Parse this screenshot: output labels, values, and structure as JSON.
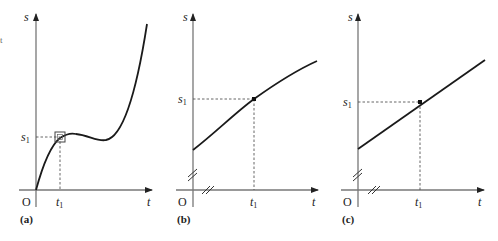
{
  "figure": {
    "edge_fragment": "t",
    "panels": [
      {
        "id": "a",
        "caption": "(a)",
        "y_axis_label": "s",
        "x_axis_label": "t",
        "origin_label": "O",
        "s1_label": "s",
        "s1_sub": "1",
        "t1_label": "t",
        "t1_sub": "1",
        "description": "cubic-like s(t) curve through origin with local max near t1, local min, then steep rise; small square box highlights point (t1, s1)"
      },
      {
        "id": "b",
        "caption": "(b)",
        "y_axis_label": "s",
        "x_axis_label": "t",
        "origin_label": "O",
        "s1_label": "s",
        "s1_sub": "1",
        "t1_label": "t",
        "t1_sub": "1",
        "description": "magnified view: slightly curved segment with point (t1, s1); broken axes"
      },
      {
        "id": "c",
        "caption": "(c)",
        "y_axis_label": "s",
        "x_axis_label": "t",
        "origin_label": "O",
        "s1_label": "s",
        "s1_sub": "1",
        "t1_label": "t",
        "t1_sub": "1",
        "description": "further magnified view: curve appears as a straight line through (t1, s1); broken axes"
      }
    ]
  }
}
